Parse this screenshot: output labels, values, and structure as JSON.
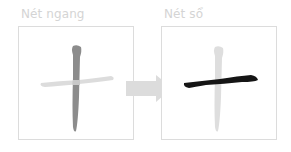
{
  "panels": [
    {
      "title": "Nét ngang",
      "character": "十",
      "highlighted_stroke": "vertical",
      "colors": {
        "vertical": "#8c8c8c",
        "horizontal": "#dcdcdc"
      }
    },
    {
      "title": "Nét sổ",
      "character": "十",
      "highlighted_stroke": "horizontal",
      "colors": {
        "horizontal": "#151515",
        "vertical": "#dedede"
      }
    }
  ],
  "arrow": {
    "icon": "arrow-right-icon",
    "color": "#dcdcdc"
  }
}
